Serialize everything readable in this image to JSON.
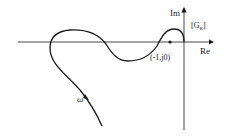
{
  "diagram": {
    "type": "nyquist-plot",
    "axes": {
      "real_label": "Re",
      "imag_label": "Im"
    },
    "plane_label": "[G",
    "plane_label_sub": "K",
    "plane_label_close": "]",
    "critical_point_label": "(-1,j0)",
    "frequency_label": "ω",
    "colors": {
      "stroke": "#1a1a1a",
      "background": "#ffffff"
    }
  }
}
